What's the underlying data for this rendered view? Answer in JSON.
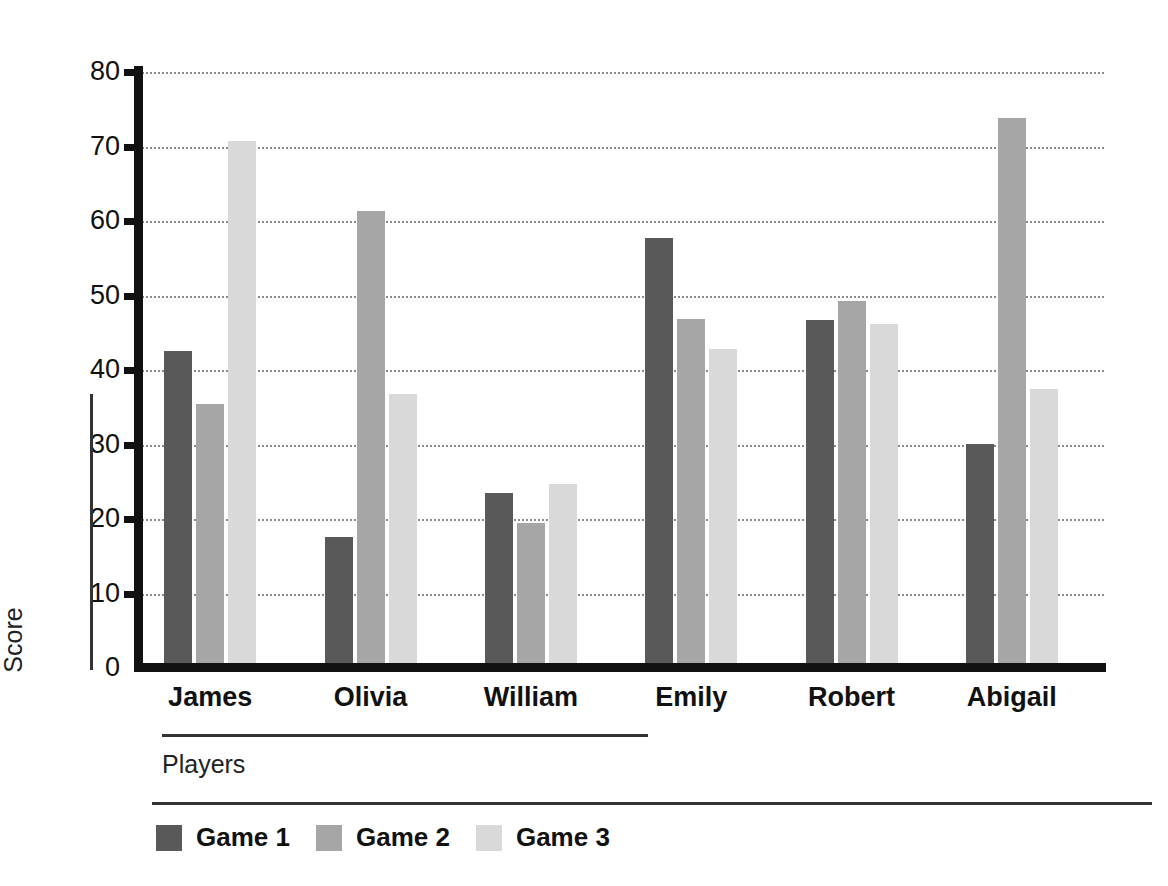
{
  "chart_data": {
    "type": "bar",
    "title": "",
    "xlabel": "Players",
    "ylabel": "Score",
    "categories": [
      "James",
      "Olivia",
      "William",
      "Emily",
      "Robert",
      "Abigail"
    ],
    "series": [
      {
        "name": "Game 1",
        "color": "#595959",
        "values": [
          42.5,
          17.6,
          23.5,
          57.7,
          46.7,
          30.1
        ]
      },
      {
        "name": "Game 2",
        "color": "#a6a6a6",
        "values": [
          35.5,
          61.3,
          19.5,
          46.8,
          49.2,
          73.8
        ]
      },
      {
        "name": "Game 3",
        "color": "#d9d9d9",
        "values": [
          70.7,
          36.8,
          24.7,
          42.8,
          46.2,
          37.5
        ]
      }
    ],
    "ylim": [
      0,
      80
    ],
    "yticks": [
      0,
      10,
      20,
      30,
      40,
      50,
      60,
      70,
      80
    ],
    "ytick_labels": [
      "0",
      "10",
      "20",
      "30",
      "40",
      "50",
      "60",
      "70",
      "80"
    ],
    "grid": true,
    "grid_style": "dotted",
    "grid_axis": "y",
    "legend": {
      "position": "bottom-left",
      "entries": [
        "Game 1",
        "Game 2",
        "Game 3"
      ]
    },
    "axis_color": "#111111",
    "background": "#ffffff"
  }
}
